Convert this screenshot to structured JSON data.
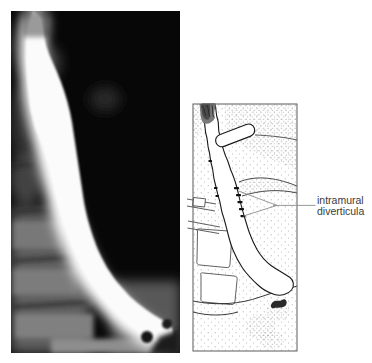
{
  "annotation": {
    "line1": "intramural",
    "line2": "diverticula"
  },
  "figure": {
    "left_panel": "barium swallow radiograph of the esophagus",
    "right_panel": "line drawing of the esophagus showing intramural diverticula"
  },
  "colors": {
    "page_background": "#ffffff",
    "radiograph_background": "#070707",
    "barium_column": "#fbfbfb",
    "drawing_line": "#1a1a1a",
    "stipple_dot": "#9b9b9b",
    "frame_line": "#5a5a5a",
    "leader_line": "#8c8c8c",
    "label_text": "#3b3b3b"
  }
}
